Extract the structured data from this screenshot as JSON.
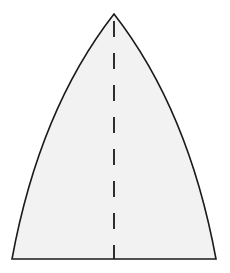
{
  "figure": {
    "shape": {
      "name": "curved-gore-panel",
      "apex": [
        114,
        14
      ],
      "bottom_left": [
        12,
        259
      ],
      "bottom_right": [
        216,
        259
      ],
      "fill_color": "#f2f2f2",
      "stroke_color": "#1a1a1a",
      "stroke_width": 1.6
    },
    "center_line": {
      "name": "fold-line",
      "x": 114,
      "y_start": 14,
      "y_end": 259,
      "style": "dashed",
      "dash_pattern": "16 16",
      "stroke_color": "#1a1a1a",
      "stroke_width": 1.8
    },
    "background_color": "#ffffff"
  }
}
